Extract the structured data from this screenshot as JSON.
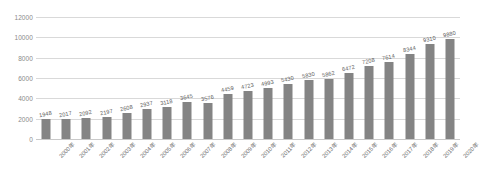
{
  "chart_data": {
    "type": "bar",
    "title": "",
    "xlabel": "",
    "ylabel": "",
    "ylim": [
      0,
      12000
    ],
    "ytick_step": 2000,
    "yticks": [
      "0",
      "2000",
      "4000",
      "6000",
      "8000",
      "10000",
      "12000"
    ],
    "grid": true,
    "legend": "none",
    "bar_color": "#848484",
    "categories": [
      "2000年",
      "2001年",
      "2002年",
      "2003年",
      "2004年",
      "2005年",
      "2006年",
      "2007年",
      "2008年",
      "2009年",
      "2010年",
      "2011年",
      "2012年",
      "2013年",
      "2014年",
      "2015年",
      "2016年",
      "2017年",
      "2018年",
      "2019年",
      "2020年"
    ],
    "values": [
      1948,
      2017,
      2092,
      2197,
      2608,
      2937,
      3118,
      3645,
      3576,
      4459,
      4723,
      4993,
      5430,
      5830,
      5862,
      6472,
      7208,
      7614,
      8344,
      9310,
      9880
    ],
    "data_labels": [
      "1948",
      "2017",
      "2092",
      "2197",
      "2608",
      "2937",
      "3118",
      "3645",
      "3576",
      "4459",
      "4723",
      "4993",
      "5430",
      "5830",
      "5862",
      "6472",
      "7208",
      "7614",
      "8344",
      "9310",
      "9880"
    ]
  }
}
